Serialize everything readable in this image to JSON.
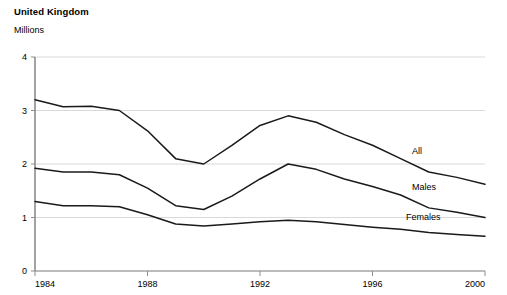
{
  "header": {
    "title": "United Kingdom",
    "subtitle": "Millions"
  },
  "chart_data": {
    "type": "line",
    "title": "United Kingdom",
    "subtitle": "Millions",
    "xlabel": "",
    "ylabel": "Millions",
    "xlim": [
      1984,
      2000
    ],
    "ylim": [
      0,
      4
    ],
    "yticks": [
      0,
      1,
      2,
      3,
      4
    ],
    "ytick_labels": [
      "0",
      "1",
      "2",
      "3",
      "4"
    ],
    "xticks": [
      1984,
      1988,
      1992,
      1996,
      2000
    ],
    "xtick_labels": [
      "1984",
      "1988",
      "1992",
      "1996",
      "2000"
    ],
    "grid": "horizontal",
    "legend_position": "inline-right",
    "line_color": "#1a1a1a",
    "grid_color": "#d9d9d9",
    "axis_color": "#808080",
    "x": [
      1984,
      1985,
      1986,
      1987,
      1988,
      1989,
      1990,
      1991,
      1992,
      1993,
      1994,
      1995,
      1996,
      1997,
      1998,
      1999,
      2000
    ],
    "series": [
      {
        "name": "All",
        "label": "All",
        "values": [
          3.2,
          3.07,
          3.08,
          3.0,
          2.62,
          2.1,
          2.0,
          2.35,
          2.72,
          2.9,
          2.78,
          2.55,
          2.35,
          2.1,
          1.85,
          1.75,
          1.62
        ]
      },
      {
        "name": "Males",
        "label": "Males",
        "values": [
          1.92,
          1.85,
          1.85,
          1.8,
          1.55,
          1.22,
          1.15,
          1.4,
          1.72,
          2.0,
          1.9,
          1.72,
          1.58,
          1.42,
          1.18,
          1.1,
          1.0
        ]
      },
      {
        "name": "Females",
        "label": "Females",
        "values": [
          1.3,
          1.22,
          1.22,
          1.2,
          1.05,
          0.88,
          0.84,
          0.88,
          0.92,
          0.95,
          0.92,
          0.87,
          0.82,
          0.78,
          0.72,
          0.68,
          0.65
        ]
      }
    ]
  },
  "series_labels": {
    "all": "All",
    "males": "Males",
    "females": "Females"
  }
}
